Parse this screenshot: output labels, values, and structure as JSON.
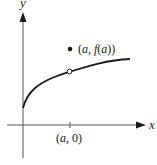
{
  "diagram": {
    "axes": {
      "x_label": "x",
      "y_label": "y"
    },
    "point_filled": {
      "label_open": "(",
      "label_a": "a",
      "label_comma": ", ",
      "label_f": "f",
      "label_paren_a": "(",
      "label_a2": "a",
      "label_close": "))",
      "full_label": "(a, f(a))"
    },
    "point_open": {
      "description": "hole on curve at x = a"
    },
    "tick": {
      "label_open": "(",
      "label_a": "a",
      "label_rest": ", 0)",
      "full_label": "(a, 0)"
    },
    "colors": {
      "ink": "#1a1a1a",
      "axis": "#555555",
      "background": "#ffffff"
    }
  }
}
